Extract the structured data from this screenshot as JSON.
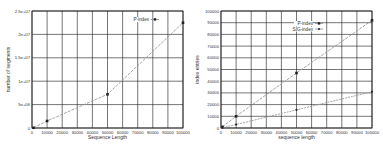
{
  "chart_data": [
    {
      "type": "line",
      "title": "",
      "xlabel": "Sequence Length",
      "ylabel": "number of segments",
      "xlim": [
        0,
        100000
      ],
      "ylim": [
        0,
        25000000
      ],
      "xticks": [
        "0",
        "10000",
        "20000",
        "30000",
        "40000",
        "50000",
        "60000",
        "70000",
        "80000",
        "90000",
        "100000"
      ],
      "yticks": [
        "0",
        "5e+06",
        "1e+07",
        "1.5e+07",
        "2e+07",
        "2.5e+07"
      ],
      "grid": true,
      "legend_position": "upper right",
      "series": [
        {
          "name": "P-index",
          "x": [
            1000,
            10000,
            50000,
            100000
          ],
          "values": [
            50000,
            1500000,
            7200000,
            22500000
          ]
        }
      ]
    },
    {
      "type": "line",
      "title": "",
      "xlabel": "sequence length",
      "ylabel": "index entries",
      "xlim": [
        0,
        100000
      ],
      "ylim": [
        0,
        100000
      ],
      "xticks": [
        "0",
        "10000",
        "20000",
        "30000",
        "40000",
        "50000",
        "60000",
        "70000",
        "80000",
        "90000",
        "100000"
      ],
      "yticks": [
        "0",
        "10000",
        "20000",
        "30000",
        "40000",
        "50000",
        "60000",
        "70000",
        "80000",
        "90000",
        "100000"
      ],
      "grid": true,
      "legend_position": "upper right",
      "series": [
        {
          "name": "P-index",
          "x": [
            1000,
            10000,
            50000,
            100000
          ],
          "values": [
            1000,
            10000,
            47000,
            92000
          ]
        },
        {
          "name": "SIG-index",
          "x": [
            1000,
            10000,
            50000,
            100000
          ],
          "values": [
            300,
            3000,
            15500,
            31000
          ]
        }
      ]
    }
  ],
  "colors": {
    "grid": "#1a1a1a",
    "line": "#9a9a9a",
    "marker": "#222222",
    "text": "#333333"
  }
}
